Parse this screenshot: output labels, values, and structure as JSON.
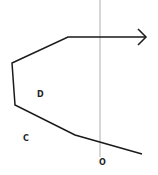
{
  "diagram": {
    "type": "geometry-path",
    "colors": {
      "path": "#1a1a1a",
      "axis": "#c8c8c8",
      "label": "#222222"
    },
    "axis_line": {
      "x": 100,
      "y1": 0,
      "y2": 157
    },
    "path_points": [
      [
        142,
        154
      ],
      [
        75,
        135
      ],
      [
        15,
        105
      ],
      [
        12,
        63
      ],
      [
        68,
        37
      ],
      [
        146,
        37
      ]
    ],
    "arrow_head": {
      "tip": [
        146,
        37
      ],
      "size": 8
    },
    "labels": [
      {
        "id": "D",
        "text": "D",
        "x": 37,
        "y": 97
      },
      {
        "id": "C",
        "text": "C",
        "x": 23,
        "y": 141
      },
      {
        "id": "O",
        "text": "O",
        "x": 99,
        "y": 165
      }
    ]
  }
}
